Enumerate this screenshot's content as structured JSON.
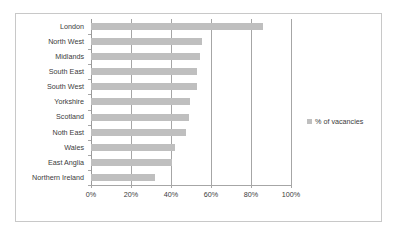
{
  "chart_data": {
    "type": "bar",
    "orientation": "horizontal",
    "title": "",
    "xlabel": "",
    "ylabel": "",
    "categories": [
      "London",
      "North West",
      "Midlands",
      "South East",
      "South West",
      "Yorkshire",
      "Scotland",
      "Noth East",
      "Wales",
      "East Anglia",
      "Northern Ireland"
    ],
    "values": [
      86,
      55.5,
      54.5,
      53,
      53,
      49.5,
      49,
      47.5,
      42,
      40.5,
      32
    ],
    "series": [
      {
        "name": "% of vacancies",
        "values": [
          86,
          55.5,
          54.5,
          53,
          53,
          49.5,
          49,
          47.5,
          42,
          40.5,
          32
        ]
      }
    ],
    "xlim": [
      0,
      100
    ],
    "xticks": [
      0,
      20,
      40,
      60,
      80,
      100
    ],
    "xtick_labels": [
      "0%",
      "20%",
      "40%",
      "60%",
      "80%",
      "100%"
    ],
    "grid": "vertical",
    "legend_position": "right",
    "bar_color": "#bfbfbf",
    "gridline_color": "#a6a6a6",
    "text_color": "#3b3b3b",
    "frame_color": "#c8c8c8",
    "background": "#ffffff"
  },
  "legend": {
    "entries": [
      {
        "label": "% of vacancies",
        "color": "#bfbfbf"
      }
    ]
  }
}
